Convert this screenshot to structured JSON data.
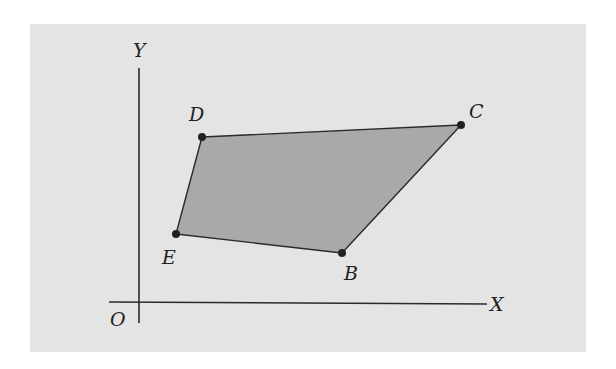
{
  "figure": {
    "background_color": "#e4e4e4",
    "fill_color": "#a9a9a9",
    "stroke_color": "#2a2a2a",
    "point_color": "#222222"
  },
  "axes": {
    "x_label": "X",
    "y_label": "Y",
    "origin_label": "O"
  },
  "polygon": {
    "name": "EDCB",
    "vertices": [
      {
        "label": "E",
        "x": 176,
        "y": 234
      },
      {
        "label": "D",
        "x": 202,
        "y": 137
      },
      {
        "label": "C",
        "x": 461,
        "y": 125
      },
      {
        "label": "B",
        "x": 342,
        "y": 253
      }
    ]
  },
  "labels": {
    "E": "E",
    "D": "D",
    "C": "C",
    "B": "B"
  }
}
